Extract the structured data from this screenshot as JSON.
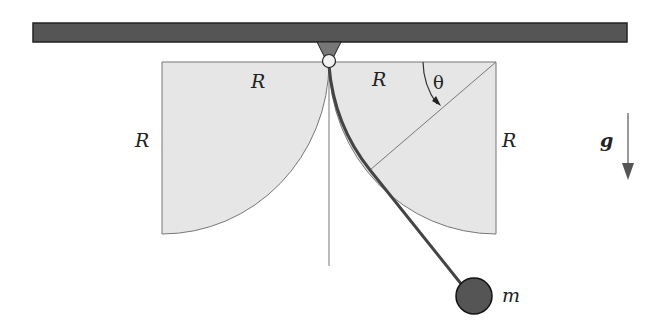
{
  "diagram": {
    "labels": {
      "radius_left_top": "R",
      "radius_right_top": "R",
      "radius_left_side": "R",
      "radius_right_side": "R",
      "angle": "θ",
      "gravity": "g",
      "mass": "m"
    },
    "colors": {
      "ceiling": "#555555",
      "ceiling_border": "#222222",
      "mount": "#777777",
      "cheek_fill": "#e6e6e6",
      "cheek_stroke": "#777777",
      "string": "#444444",
      "bob": "#555555",
      "arrow": "#555555"
    }
  }
}
